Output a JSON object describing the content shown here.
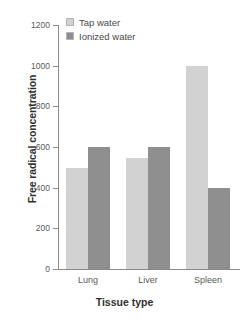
{
  "chart_data": {
    "type": "bar",
    "title": "",
    "xlabel": "Tissue type",
    "ylabel": "Free radical concentration",
    "categories": [
      "Lung",
      "Liver",
      "Spleen"
    ],
    "series": [
      {
        "name": "Tap water",
        "color": "#d2d2d2",
        "values": [
          495,
          548,
          1000
        ]
      },
      {
        "name": "Ionized water",
        "color": "#8f8f8f",
        "values": [
          600,
          600,
          400
        ]
      }
    ],
    "ylim": [
      0,
      1200
    ],
    "ytick_step": 200,
    "yticks": [
      0,
      200,
      400,
      600,
      800,
      1000,
      1200
    ],
    "ytick_labels": [
      "0",
      "200",
      "400",
      "600",
      "800",
      "1000",
      "1200"
    ],
    "grid": false,
    "legend_position": "top-left-inside",
    "axis_color": "#8a8a8a",
    "tick_direction": "out"
  }
}
